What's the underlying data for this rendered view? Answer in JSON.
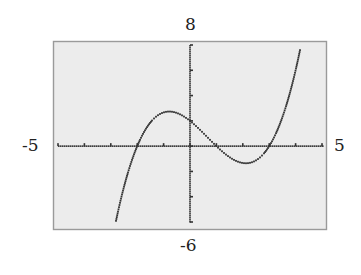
{
  "window": {
    "xmin": "-5",
    "xmax": "5",
    "ymin": "-6",
    "ymax": "8"
  },
  "colors": {
    "screen_bg": "#ececec",
    "frame": "#9a9a9a",
    "ink": "#333333"
  },
  "chart_data": {
    "type": "line",
    "title": "",
    "xlabel": "",
    "ylabel": "",
    "xlim": [
      -5,
      5
    ],
    "ylim": [
      -6,
      8
    ],
    "xscale": 1,
    "yscale": 2,
    "grid": false,
    "legend": null,
    "style": "graphing-calculator dotted pixel plot",
    "function": "y = (1/3)(x + 2)(x - 1)(x - 3)",
    "x_intercepts": [
      -2,
      1,
      3
    ],
    "y_intercept": 2,
    "local_max": {
      "x": -0.8,
      "y": 2.7
    },
    "local_min": {
      "x": 2.1,
      "y": -1.4
    },
    "series": [
      {
        "name": "f(x)",
        "x": [
          -2.8,
          -2.5,
          -2.0,
          -1.5,
          -1.0,
          -0.5,
          0.0,
          0.5,
          1.0,
          1.5,
          2.0,
          2.5,
          3.0,
          3.5,
          4.0,
          4.3
        ],
        "y": [
          -5.1,
          -2.6,
          0.0,
          1.6,
          2.7,
          2.9,
          2.0,
          0.9,
          0.0,
          -0.75,
          -1.3,
          -1.1,
          0.0,
          1.6,
          4.0,
          5.8
        ]
      }
    ],
    "tick_labels": {
      "x": [
        "-5",
        "5"
      ],
      "y": [
        "-6",
        "8"
      ]
    }
  }
}
